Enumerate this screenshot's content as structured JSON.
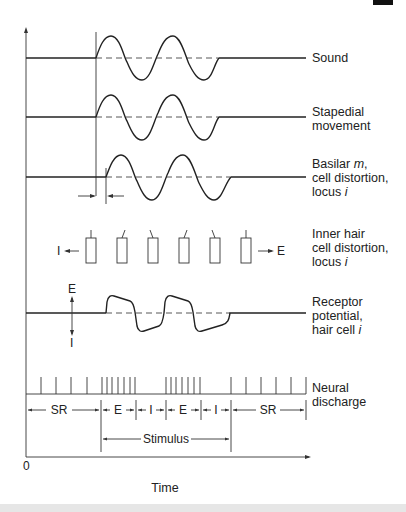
{
  "figure": {
    "traces": [
      {
        "id": "sound",
        "label_lines": [
          "Sound"
        ]
      },
      {
        "id": "stapedial",
        "label_lines": [
          "Stapedial",
          "movement"
        ]
      },
      {
        "id": "basilar",
        "label_lines": [
          "Basilar m,",
          "cell distortion,",
          "locus i"
        ]
      },
      {
        "id": "inner-hair",
        "label_lines": [
          "Inner hair",
          "cell distortion,",
          "locus i"
        ]
      },
      {
        "id": "receptor",
        "label_lines": [
          "Receptor",
          "potential,",
          "hair cell i"
        ]
      },
      {
        "id": "neural",
        "label_lines": [
          "Neural",
          "discharge"
        ]
      }
    ],
    "hair_cells": {
      "left_label": "I",
      "right_label": "E"
    },
    "receptor_axis": {
      "top_label": "E",
      "bottom_label": "I"
    },
    "phases": [
      "SR",
      "E",
      "I",
      "E",
      "I",
      "SR"
    ],
    "stimulus_label": "Stimulus",
    "x_axis": {
      "origin_label": "0",
      "label": "Time"
    }
  }
}
